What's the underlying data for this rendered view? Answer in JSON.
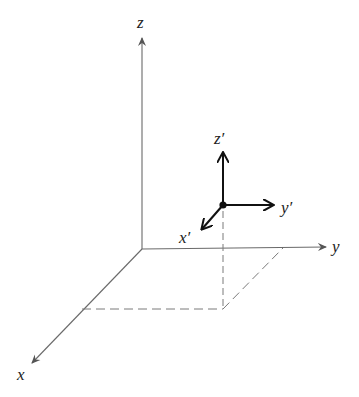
{
  "diagram": {
    "title": "",
    "colors": {
      "main_axes": "#6a6a6a",
      "prime_axes": "#111111",
      "dashed": "#7a7a7a",
      "labels": "#222222",
      "background": "#ffffff"
    },
    "main_frame": {
      "origin": [
        142,
        249
      ],
      "axes": [
        {
          "name": "z",
          "label": "z",
          "tip": [
            142,
            36
          ],
          "label_pos": [
            137,
            28
          ]
        },
        {
          "name": "y",
          "label": "y",
          "tip": [
            328,
            247
          ],
          "label_pos": [
            332,
            252
          ]
        },
        {
          "name": "x",
          "label": "x",
          "tip": [
            30,
            365
          ],
          "label_pos": [
            17,
            380
          ]
        }
      ]
    },
    "prime_frame": {
      "origin": [
        223,
        205
      ],
      "point": "origin-dot",
      "axes": [
        {
          "name": "z-prime",
          "label": "z′",
          "tip": [
            223,
            151
          ],
          "label_pos": [
            214,
            144
          ]
        },
        {
          "name": "y-prime",
          "label": "y′",
          "tip": [
            275,
            205
          ],
          "label_pos": [
            281,
            213
          ]
        },
        {
          "name": "x-prime",
          "label": "x′",
          "tip": [
            200,
            231
          ],
          "label_pos": [
            179,
            243
          ]
        }
      ]
    },
    "projection": {
      "description": "dashed parallelogram in xy-plane below the primed origin",
      "corners": [
        [
          82,
          309
        ],
        [
          223,
          309
        ],
        [
          283,
          248
        ]
      ],
      "vertical_drop": {
        "from": [
          223,
          210
        ],
        "to": [
          223,
          309
        ]
      }
    }
  }
}
